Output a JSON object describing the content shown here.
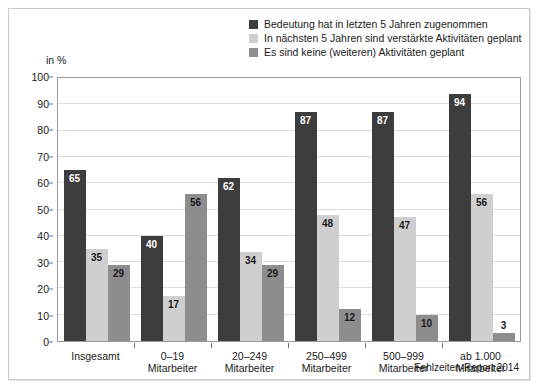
{
  "figure": {
    "unit_label": "in %",
    "source_note": "Fehlzeiten-Report 2014"
  },
  "legend": {
    "items": [
      {
        "label": "Bedeutung hat in letzten 5 Jahren zugenommen",
        "color": "#3d3d3d"
      },
      {
        "label": "In nächsten 5 Jahren sind verstärkte Aktivitäten geplant",
        "color": "#cfcfcf"
      },
      {
        "label": "Es sind keine (weiteren) Aktivitäten geplant",
        "color": "#8d8d8d"
      }
    ]
  },
  "chart_data": {
    "type": "bar",
    "title": "",
    "subtitle": "",
    "xlabel": "",
    "ylabel": "in %",
    "ylim": [
      0,
      100
    ],
    "yticks": [
      0,
      10,
      20,
      30,
      40,
      50,
      60,
      70,
      80,
      90,
      100
    ],
    "ytick_labels": [
      "0",
      "10",
      "20",
      "30",
      "40",
      "50",
      "60",
      "70",
      "80",
      "90",
      "100"
    ],
    "grid": true,
    "legend_position": "top-right",
    "categories": [
      "Insgesamt",
      "0–19\nMitarbeiter",
      "20–249\nMitarbeiter",
      "250–499\nMitarbeiter",
      "500–999\nMitarbeiter",
      "ab 1.000\nMitarbeiter"
    ],
    "category_lines": [
      [
        "Insgesamt",
        ""
      ],
      [
        "0–19",
        "Mitarbeiter"
      ],
      [
        "20–249",
        "Mitarbeiter"
      ],
      [
        "250–499",
        "Mitarbeiter"
      ],
      [
        "500–999",
        "Mitarbeiter"
      ],
      [
        "ab 1.000",
        "Mitarbeiter"
      ]
    ],
    "series": [
      {
        "name": "Bedeutung hat in letzten 5 Jahren zugenommen",
        "color": "#3d3d3d",
        "values": [
          65,
          40,
          62,
          87,
          87,
          94
        ]
      },
      {
        "name": "In nächsten 5 Jahren sind verstärkte Aktivitäten geplant",
        "color": "#cfcfcf",
        "values": [
          35,
          17,
          34,
          48,
          47,
          56
        ]
      },
      {
        "name": "Es sind keine (weiteren) Aktivitäten geplant",
        "color": "#8d8d8d",
        "values": [
          29,
          56,
          29,
          12,
          10,
          3
        ]
      }
    ]
  }
}
